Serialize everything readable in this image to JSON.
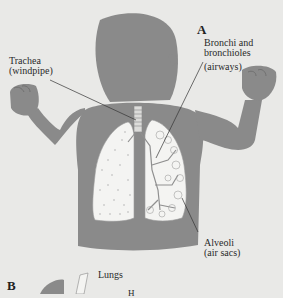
{
  "figure": {
    "panel_a": {
      "letter": "A",
      "labels": {
        "trachea": {
          "line1": "Trachea",
          "line2": "(windpipe)"
        },
        "bronchi": {
          "line1": "Bronchi and",
          "line2": "bronchioles",
          "line3": "(airways)"
        },
        "alveoli": {
          "line1": "Alveoli",
          "line2": "(air sacs)"
        }
      }
    },
    "panel_b": {
      "letter": "B",
      "labels": {
        "lungs": "Lungs",
        "partial": "H"
      }
    },
    "colors": {
      "background": "#e9e9e7",
      "body": "#8a8a8a",
      "lung_fill": "#f4f4f2",
      "leader_line": "#333333"
    }
  }
}
